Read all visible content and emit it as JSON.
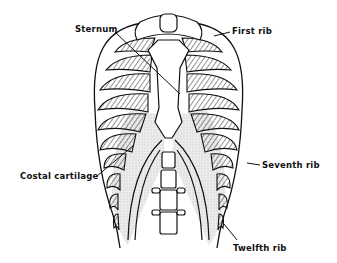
{
  "figure": {
    "labels": {
      "sternum": "Sternum",
      "first_rib": "First rib",
      "costal_cartilage": "Costal cartilage",
      "seventh_rib": "Seventh rib",
      "twelfth_rib": "Twelfth rib"
    }
  },
  "colors": {
    "line": "#111111",
    "background": "#ffffff",
    "stipple": "#d6d6d6"
  }
}
